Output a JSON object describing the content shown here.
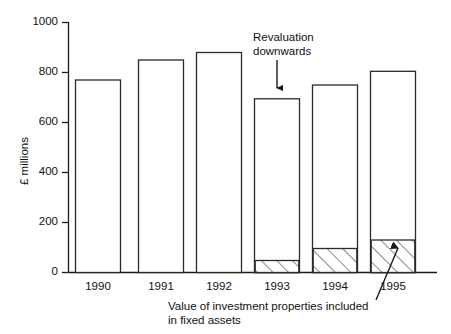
{
  "chart_data": {
    "type": "bar",
    "title": "",
    "subtitle": "",
    "xlabel": "",
    "ylabel": "£ millions",
    "categories": [
      "1990",
      "1991",
      "1992",
      "1993",
      "1994",
      "1995"
    ],
    "ylim": [
      0,
      1000
    ],
    "yticks": [
      0,
      200,
      400,
      600,
      800,
      1000
    ],
    "ytick_labels": [
      "0",
      "200",
      "400",
      "600",
      "800",
      "1000"
    ],
    "grid": false,
    "legend_position": "none",
    "series": [
      {
        "name": "Total fixed assets",
        "fill": "none",
        "values": [
          770,
          850,
          880,
          695,
          750,
          805
        ]
      },
      {
        "name": "Value of investment properties included in fixed assets",
        "fill": "diagonal-hatch",
        "values": [
          0,
          0,
          0,
          48,
          96,
          130
        ]
      }
    ],
    "annotations": [
      {
        "name": "revaluation-note",
        "text_line1": "Revaluation",
        "text_line2": "downwards",
        "points_to": "1993"
      },
      {
        "name": "investment-properties-note",
        "text_line1": "Value of investment properties included",
        "text_line2": "in fixed assets",
        "points_to": "1995"
      }
    ],
    "colors": {
      "axis": "#1a1a1a",
      "bar_outline": "#2b2b2b",
      "bar_fill": "#ffffff",
      "hatch": "#2b2b2b",
      "text": "#111111"
    }
  },
  "axis": {
    "y_title": "£ millions",
    "y_labels": [
      "1000",
      "800",
      "600",
      "400",
      "200",
      "0"
    ],
    "x_labels": [
      "1990",
      "1991",
      "1992",
      "1993",
      "1994",
      "1995"
    ]
  },
  "annotations": {
    "revaluation": {
      "line1": "Revaluation",
      "line2": "downwards"
    },
    "investment": {
      "line1": "Value of investment properties included",
      "line2": "in fixed assets"
    }
  }
}
